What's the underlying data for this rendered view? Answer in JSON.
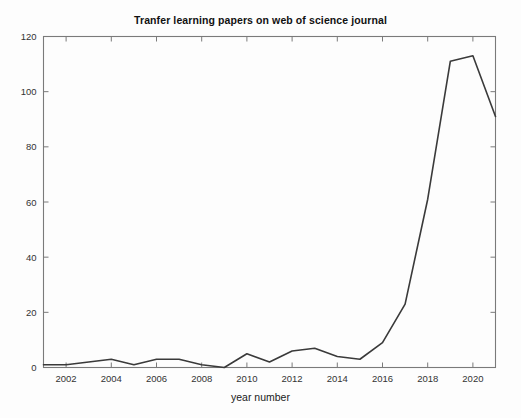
{
  "chart_data": {
    "type": "line",
    "title": "Tranfer learning papers on web of science journal",
    "xlabel": "year number",
    "ylabel": "",
    "x": [
      2001,
      2002,
      2003,
      2004,
      2005,
      2006,
      2007,
      2008,
      2009,
      2010,
      2011,
      2012,
      2013,
      2014,
      2015,
      2016,
      2017,
      2018,
      2019,
      2020,
      2021
    ],
    "values": [
      1,
      1,
      2,
      3,
      1,
      3,
      3,
      1,
      0,
      5,
      2,
      6,
      7,
      4,
      3,
      9,
      23,
      61,
      111,
      113,
      91
    ],
    "series": [
      {
        "name": "papers",
        "values": [
          1,
          1,
          2,
          3,
          1,
          3,
          3,
          1,
          0,
          5,
          2,
          6,
          7,
          4,
          3,
          9,
          23,
          61,
          111,
          113,
          91
        ]
      }
    ],
    "xlim": [
      2001,
      2021
    ],
    "ylim": [
      0,
      120
    ],
    "xticks": [
      2002,
      2004,
      2006,
      2008,
      2010,
      2012,
      2014,
      2016,
      2018,
      2020
    ],
    "xtick_labels": [
      "2002",
      "2004",
      "2006",
      "2008",
      "2010",
      "2012",
      "2014",
      "2016",
      "2018",
      "2020"
    ],
    "yticks": [
      0,
      20,
      40,
      60,
      80,
      100,
      120
    ],
    "ytick_labels": [
      "0",
      "20",
      "40",
      "60",
      "80",
      "100",
      "120"
    ],
    "grid": false,
    "legend": null,
    "line_color": "#3a3a3a",
    "axis_color": "#7a7a7a",
    "background_color": "#ffffff"
  }
}
